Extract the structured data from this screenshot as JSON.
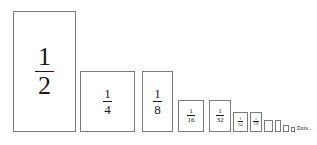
{
  "figure": {
    "background_color": "#ffffff",
    "border_color": "#7a7a7a",
    "text_color": "#1a1a1a",
    "baseline_y": 132,
    "ellipsis_label": "Dots..."
  },
  "chart_data": {
    "type": "bar",
    "title": "",
    "subtitle": "",
    "xlabel": "",
    "ylabel": "",
    "grid": false,
    "legend": "none",
    "orientation": "vertical",
    "baseline_shared": true,
    "categories": [
      "1/2",
      "1/4",
      "1/8",
      "1/16",
      "1/32",
      "1/64",
      "1/128",
      "1/256",
      "1/512",
      "1/1024",
      "1/2048"
    ],
    "values": [
      0.5,
      0.25,
      0.125,
      0.0625,
      0.03125,
      0.015625,
      0.0078125,
      0.00390625,
      0.001953125,
      0.0009765625,
      0.00048828125
    ],
    "ylim": [
      0,
      0.5
    ],
    "terms": [
      {
        "label": "1/2",
        "numerator": "1",
        "denominator": "2",
        "value": 0.5,
        "x": 13,
        "y": 11,
        "width": 63,
        "height": 121,
        "show_label": true
      },
      {
        "label": "1/4",
        "numerator": "1",
        "denominator": "4",
        "value": 0.25,
        "x": 80,
        "y": 71,
        "width": 55,
        "height": 61,
        "show_label": true
      },
      {
        "label": "1/8",
        "numerator": "1",
        "denominator": "8",
        "value": 0.125,
        "x": 142,
        "y": 71,
        "width": 31,
        "height": 61,
        "show_label": true
      },
      {
        "label": "1/16",
        "numerator": "1",
        "denominator": "16",
        "value": 0.0625,
        "x": 178,
        "y": 100,
        "width": 26,
        "height": 32,
        "show_label": true
      },
      {
        "label": "1/32",
        "numerator": "1",
        "denominator": "32",
        "value": 0.03125,
        "x": 209,
        "y": 100,
        "width": 22,
        "height": 32,
        "show_label": true
      },
      {
        "label": "1/64",
        "numerator": "1",
        "denominator": "64",
        "value": 0.015625,
        "x": 233,
        "y": 112,
        "width": 15,
        "height": 20,
        "show_label": true
      },
      {
        "label": "1/128",
        "numerator": "1",
        "denominator": "128",
        "value": 0.0078125,
        "x": 250,
        "y": 112,
        "width": 12,
        "height": 20,
        "show_label": true
      },
      {
        "label": "1/256",
        "numerator": "1",
        "denominator": "256",
        "value": 0.00390625,
        "x": 264,
        "y": 120,
        "width": 9,
        "height": 12,
        "show_label": false
      },
      {
        "label": "1/512",
        "numerator": "1",
        "denominator": "512",
        "value": 0.001953125,
        "x": 275,
        "y": 120,
        "width": 6,
        "height": 12,
        "show_label": false
      },
      {
        "label": "1/1024",
        "numerator": "1",
        "denominator": "1024",
        "value": 0.0009765625,
        "x": 283,
        "y": 125,
        "width": 6,
        "height": 7,
        "show_label": false
      },
      {
        "label": "1/2048",
        "numerator": "1",
        "denominator": "2048",
        "value": 0.00048828125,
        "x": 291,
        "y": 127,
        "width": 4,
        "height": 5,
        "show_label": false
      }
    ],
    "ellipsis": {
      "text": "Dots...",
      "x": 297,
      "y": 126
    }
  }
}
